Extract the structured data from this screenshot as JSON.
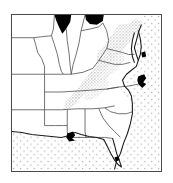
{
  "figure": {
    "kind": "species-distribution-map",
    "region_title": "Southeastern United States",
    "caption": "",
    "background_color": "#ffffff",
    "frame": {
      "border_color": "#4a4a4a",
      "border_width_px": 1,
      "x": 11,
      "y": 14,
      "width": 151,
      "height": 158
    }
  },
  "map": {
    "projection_view": "eastern and southeastern United States",
    "land_fill": "#ffffff",
    "state_outline_color": "#3a3a3a",
    "coastline_color": "#1a1a1a",
    "legend_items": [
      {
        "key": "water-stipple",
        "label": "Ocean / Gulf waters",
        "pattern": "light-dot-stipple",
        "color": "#b9b9b9"
      },
      {
        "key": "range-stipple",
        "label": "Species range (Appalachian corridor)",
        "pattern": "dense-dot-stipple",
        "color": "#8d8d8d"
      },
      {
        "key": "solid-black",
        "label": "Great Lakes and coastal water bodies",
        "pattern": "solid-fill",
        "color": "#000000"
      }
    ],
    "water_bodies": [
      {
        "name": "atlantic-ocean",
        "fill": "light-dot-stipple"
      },
      {
        "name": "gulf-of-mexico",
        "fill": "light-dot-stipple"
      },
      {
        "name": "lake-michigan-tip",
        "fill": "solid-black"
      },
      {
        "name": "lake-erie-tip",
        "fill": "solid-black"
      },
      {
        "name": "chesapeake-bay",
        "fill": "outline-and-stipple"
      }
    ],
    "range_shading": {
      "name": "appalachian-range-band",
      "description": "diagonal stippled band from Virginia / West Virginia southwest into western North Carolina and eastern Tennessee",
      "fill": "dense-dot-stipple"
    },
    "landmarks": [
      {
        "name": "florida-peninsula"
      },
      {
        "name": "cape-hatteras"
      },
      {
        "name": "mississippi-river-delta"
      },
      {
        "name": "delmarva-peninsula"
      }
    ],
    "states_outlined": [
      "Missouri",
      "Illinois",
      "Indiana",
      "Ohio",
      "Kentucky",
      "West Virginia",
      "Virginia",
      "Maryland",
      "Tennessee",
      "North Carolina",
      "South Carolina",
      "Georgia",
      "Florida",
      "Alabama",
      "Mississippi",
      "Louisiana",
      "Arkansas"
    ]
  }
}
